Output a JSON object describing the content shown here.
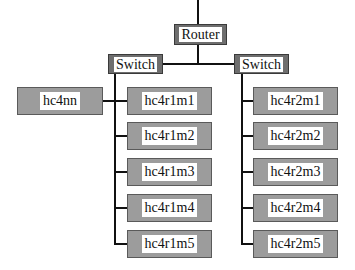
{
  "diagram": {
    "router": {
      "label": "Router"
    },
    "switches": [
      {
        "label": "Switch"
      },
      {
        "label": "Switch"
      }
    ],
    "standalone": {
      "label": "hc4nn"
    },
    "rack1": [
      "hc4r1m1",
      "hc4r1m2",
      "hc4r1m3",
      "hc4r1m4",
      "hc4r1m5"
    ],
    "rack2": [
      "hc4r2m1",
      "hc4r2m2",
      "hc4r2m3",
      "hc4r2m4",
      "hc4r2m5"
    ],
    "colors": {
      "node_fill": "#9c9c9c",
      "switch_fill": "#6e6e6e",
      "line": "#111111",
      "label_bg": "#ffffff"
    }
  }
}
